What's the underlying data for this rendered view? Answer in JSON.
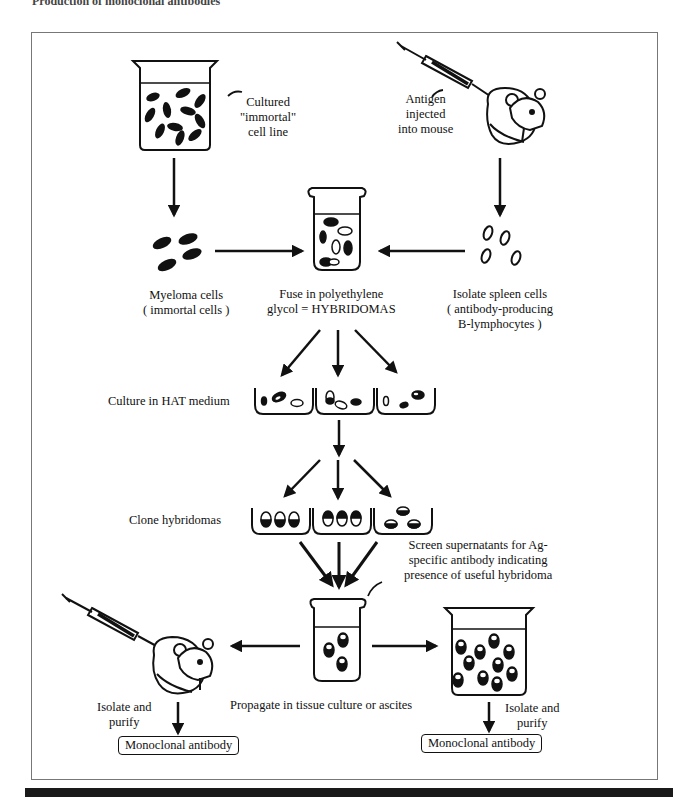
{
  "header": {
    "title": "Production of monoclonal antibodies"
  },
  "labels": {
    "cultured_line": [
      "Cultured",
      "\"immortal\"",
      "cell line"
    ],
    "antigen": [
      "Antigen",
      "injected",
      "into mouse"
    ],
    "myeloma": [
      "Myeloma cells",
      "( immortal cells )"
    ],
    "fuse": [
      "Fuse in polyethylene",
      "glycol = HYBRIDOMAS"
    ],
    "spleen": [
      "Isolate spleen cells",
      "( antibody-producing",
      "B-lymphocytes )"
    ],
    "hat": "Culture in HAT medium",
    "clone": "Clone hybridomas",
    "screen": [
      "Screen supernatants for Ag-",
      "specific antibody indicating",
      "presence of useful hybridoma"
    ],
    "propagate": "Propagate in tissue culture or ascites",
    "isolate_left": [
      "Isolate and",
      "purify"
    ],
    "isolate_right": [
      "Isolate and",
      "purify"
    ]
  },
  "outputs": {
    "left": "Monoclonal antibody",
    "right": "Monoclonal antibody"
  },
  "icons": {
    "beaker": "beaker-icon",
    "syringe": "syringe-icon",
    "mouse": "mouse-icon",
    "test_tube": "test-tube-icon",
    "well": "culture-well-icon",
    "arrow": "arrow-icon"
  }
}
